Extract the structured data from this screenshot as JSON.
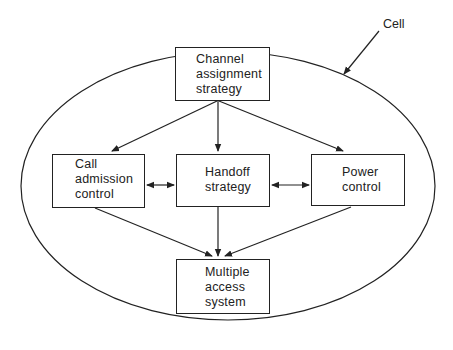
{
  "cell_label": "Cell",
  "nodes": {
    "channel": {
      "lines": [
        "Channel",
        "assignment",
        "strategy"
      ]
    },
    "call": {
      "lines": [
        "Call",
        "admission",
        "control"
      ]
    },
    "handoff": {
      "lines": [
        "Handoff",
        "strategy"
      ]
    },
    "power": {
      "lines": [
        "Power",
        "control"
      ]
    },
    "multiple": {
      "lines": [
        "Multiple",
        "access",
        "system"
      ]
    }
  },
  "edges": [
    {
      "from": "channel",
      "to": "call",
      "type": "directed"
    },
    {
      "from": "channel",
      "to": "handoff",
      "type": "directed"
    },
    {
      "from": "channel",
      "to": "power",
      "type": "directed"
    },
    {
      "from": "call",
      "to": "handoff",
      "type": "bidirectional"
    },
    {
      "from": "handoff",
      "to": "power",
      "type": "bidirectional"
    },
    {
      "from": "call",
      "to": "multiple",
      "type": "directed"
    },
    {
      "from": "handoff",
      "to": "multiple",
      "type": "directed"
    },
    {
      "from": "power",
      "to": "multiple",
      "type": "directed"
    }
  ]
}
